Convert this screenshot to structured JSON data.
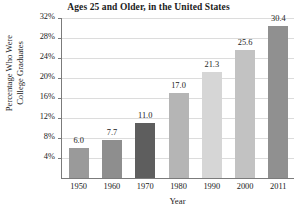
{
  "chart_data": {
    "type": "bar",
    "title": "Ages 25 and Older, in the United States",
    "xlabel": "Year",
    "ylabel_line1": "Percentage Who Were",
    "ylabel_line2": "College Graduates",
    "categories": [
      "1950",
      "1960",
      "1970",
      "1980",
      "1990",
      "2000",
      "2011"
    ],
    "values": [
      6.0,
      7.7,
      11.0,
      17.0,
      21.3,
      25.6,
      30.4
    ],
    "value_labels": [
      "6.0",
      "7.7",
      "11.0",
      "17.0",
      "21.3",
      "25.6",
      "30.4"
    ],
    "bar_colors": [
      "#9a9a9a",
      "#8e8e8e",
      "#5e5e5e",
      "#b5b5b5",
      "#d6d6d6",
      "#c2c2c2",
      "#909090"
    ],
    "ytick_labels": [
      "32%",
      "28%",
      "24%",
      "20%",
      "16%",
      "12%",
      "8%",
      "4%"
    ],
    "ytick_values": [
      32,
      28,
      24,
      20,
      16,
      12,
      8,
      4
    ],
    "ylim": [
      0,
      32
    ],
    "grid": true,
    "legend": "none",
    "grid_color": "#dcdcdc",
    "axis_color": "#7b7b7b"
  }
}
